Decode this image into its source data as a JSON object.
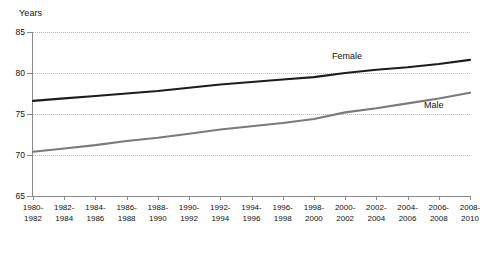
{
  "chart_data": {
    "type": "line",
    "title": "",
    "ylabel": "Years",
    "xlabel": "",
    "ylim": [
      65,
      85
    ],
    "yticks": [
      85,
      80,
      75,
      70,
      65
    ],
    "grid": true,
    "legend_position": "inline-annotation",
    "categories": [
      "1980-1982",
      "1982-1984",
      "1984-1986",
      "1986-1988",
      "1988-1990",
      "1990-1992",
      "1992-1994",
      "1994-1996",
      "1996-1998",
      "1998-2000",
      "2000-2002",
      "2002-2004",
      "2004-2006",
      "2006-2008",
      "2008-2010"
    ],
    "category_lines": [
      [
        "1980-",
        "1982"
      ],
      [
        "1982-",
        "1984"
      ],
      [
        "1984-",
        "1986"
      ],
      [
        "1986-",
        "1988"
      ],
      [
        "1988-",
        "1990"
      ],
      [
        "1990-",
        "1992"
      ],
      [
        "1992-",
        "1994"
      ],
      [
        "1994-",
        "1996"
      ],
      [
        "1996-",
        "1998"
      ],
      [
        "1998-",
        "2000"
      ],
      [
        "2000-",
        "2002"
      ],
      [
        "2002-",
        "2004"
      ],
      [
        "2004-",
        "2006"
      ],
      [
        "2006-",
        "2008"
      ],
      [
        "2008-",
        "2010"
      ]
    ],
    "series": [
      {
        "name": "Female",
        "color": "#1c1c1c",
        "values": [
          76.6,
          76.9,
          77.2,
          77.5,
          77.8,
          78.2,
          78.6,
          78.9,
          79.2,
          79.5,
          80.0,
          80.4,
          80.7,
          81.1,
          81.6
        ]
      },
      {
        "name": "Male",
        "color": "#7a7a7a",
        "values": [
          70.4,
          70.8,
          71.2,
          71.7,
          72.1,
          72.6,
          73.1,
          73.5,
          73.9,
          74.4,
          75.2,
          75.7,
          76.3,
          76.9,
          77.6
        ]
      }
    ]
  },
  "annotations": {
    "female_label": "Female",
    "male_label": "Male"
  },
  "axis": {
    "y_title": "Years"
  }
}
